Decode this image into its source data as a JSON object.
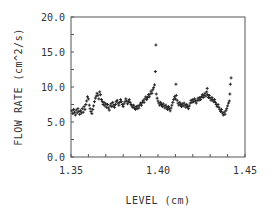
{
  "chart_data": {
    "type": "scatter",
    "title": "",
    "xlabel": "LEVEL (cm)",
    "ylabel": "FLOW RATE (cm^2/s)",
    "xlim": [
      1.35,
      1.45
    ],
    "ylim": [
      0.0,
      20.0
    ],
    "x_ticks": [
      1.35,
      1.4,
      1.45
    ],
    "x_tick_labels": [
      "1.35",
      "1.40",
      "1.45"
    ],
    "x_minor_step": 0.01,
    "y_ticks": [
      0.0,
      5.0,
      10.0,
      15.0,
      20.0
    ],
    "y_tick_labels": [
      "0.0",
      "5.0",
      "10.0",
      "15.0",
      "20.0"
    ],
    "y_minor_step": 2.5,
    "grid": false,
    "legend": null,
    "marker": "+",
    "series": [
      {
        "name": "flow rate",
        "color": "#222222",
        "points": [
          [
            1.3505,
            6.6
          ],
          [
            1.351,
            6.2
          ],
          [
            1.3515,
            6.8
          ],
          [
            1.352,
            6.4
          ],
          [
            1.3525,
            6.0
          ],
          [
            1.353,
            6.7
          ],
          [
            1.3535,
            6.3
          ],
          [
            1.354,
            6.9
          ],
          [
            1.3545,
            6.5
          ],
          [
            1.355,
            6.1
          ],
          [
            1.3555,
            6.6
          ],
          [
            1.356,
            6.3
          ],
          [
            1.3565,
            6.9
          ],
          [
            1.357,
            6.4
          ],
          [
            1.3575,
            7.2
          ],
          [
            1.358,
            6.8
          ],
          [
            1.3585,
            7.5
          ],
          [
            1.359,
            8.0
          ],
          [
            1.3595,
            8.6
          ],
          [
            1.36,
            8.3
          ],
          [
            1.3605,
            7.4
          ],
          [
            1.361,
            6.9
          ],
          [
            1.3615,
            6.5
          ],
          [
            1.362,
            6.2
          ],
          [
            1.3625,
            6.8
          ],
          [
            1.363,
            7.3
          ],
          [
            1.3635,
            7.9
          ],
          [
            1.364,
            8.4
          ],
          [
            1.3645,
            8.7
          ],
          [
            1.365,
            9.1
          ],
          [
            1.3655,
            8.8
          ],
          [
            1.366,
            8.3
          ],
          [
            1.3665,
            9.3
          ],
          [
            1.367,
            8.9
          ],
          [
            1.3675,
            8.2
          ],
          [
            1.368,
            7.9
          ],
          [
            1.3685,
            7.5
          ],
          [
            1.369,
            7.8
          ],
          [
            1.3695,
            7.3
          ],
          [
            1.37,
            7.6
          ],
          [
            1.3705,
            7.1
          ],
          [
            1.371,
            7.5
          ],
          [
            1.3715,
            7.0
          ],
          [
            1.372,
            6.7
          ],
          [
            1.3725,
            7.3
          ],
          [
            1.373,
            7.6
          ],
          [
            1.3735,
            7.2
          ],
          [
            1.374,
            7.8
          ],
          [
            1.3745,
            7.4
          ],
          [
            1.375,
            7.1
          ],
          [
            1.3755,
            7.5
          ],
          [
            1.376,
            7.9
          ],
          [
            1.3765,
            8.1
          ],
          [
            1.377,
            7.7
          ],
          [
            1.3775,
            7.4
          ],
          [
            1.378,
            7.8
          ],
          [
            1.3785,
            8.2
          ],
          [
            1.379,
            7.9
          ],
          [
            1.3795,
            7.5
          ],
          [
            1.38,
            7.2
          ],
          [
            1.3805,
            7.6
          ],
          [
            1.381,
            7.9
          ],
          [
            1.3815,
            8.3
          ],
          [
            1.382,
            8.0
          ],
          [
            1.3825,
            7.6
          ],
          [
            1.383,
            7.9
          ],
          [
            1.3835,
            8.2
          ],
          [
            1.384,
            7.8
          ],
          [
            1.3845,
            7.5
          ],
          [
            1.385,
            7.3
          ],
          [
            1.3855,
            7.1
          ],
          [
            1.386,
            7.4
          ],
          [
            1.3865,
            7.0
          ],
          [
            1.387,
            6.8
          ],
          [
            1.3875,
            7.2
          ],
          [
            1.388,
            6.9
          ],
          [
            1.3885,
            7.3
          ],
          [
            1.389,
            7.0
          ],
          [
            1.3895,
            7.4
          ],
          [
            1.39,
            7.7
          ],
          [
            1.3905,
            7.4
          ],
          [
            1.391,
            7.8
          ],
          [
            1.3915,
            8.1
          ],
          [
            1.392,
            7.8
          ],
          [
            1.3925,
            8.3
          ],
          [
            1.393,
            8.6
          ],
          [
            1.3935,
            8.2
          ],
          [
            1.394,
            8.5
          ],
          [
            1.3945,
            8.9
          ],
          [
            1.395,
            8.6
          ],
          [
            1.3955,
            9.0
          ],
          [
            1.396,
            9.4
          ],
          [
            1.3965,
            9.1
          ],
          [
            1.397,
            9.6
          ],
          [
            1.3975,
            9.9
          ],
          [
            1.398,
            10.3
          ],
          [
            1.3985,
            12.2
          ],
          [
            1.3988,
            16.0
          ],
          [
            1.399,
            9.0
          ],
          [
            1.3995,
            8.4
          ],
          [
            1.4,
            8.0
          ],
          [
            1.4005,
            7.7
          ],
          [
            1.401,
            7.4
          ],
          [
            1.4015,
            7.8
          ],
          [
            1.402,
            7.5
          ],
          [
            1.4025,
            7.2
          ],
          [
            1.403,
            7.6
          ],
          [
            1.4035,
            7.3
          ],
          [
            1.404,
            7.0
          ],
          [
            1.4045,
            7.4
          ],
          [
            1.405,
            7.1
          ],
          [
            1.4055,
            6.8
          ],
          [
            1.406,
            7.2
          ],
          [
            1.4065,
            6.9
          ],
          [
            1.407,
            6.6
          ],
          [
            1.4075,
            7.0
          ],
          [
            1.408,
            7.4
          ],
          [
            1.4085,
            7.8
          ],
          [
            1.409,
            8.2
          ],
          [
            1.4095,
            8.6
          ],
          [
            1.41,
            8.3
          ],
          [
            1.4103,
            10.4
          ],
          [
            1.4105,
            8.8
          ],
          [
            1.411,
            8.1
          ],
          [
            1.4115,
            7.7
          ],
          [
            1.412,
            7.4
          ],
          [
            1.4125,
            7.8
          ],
          [
            1.413,
            7.5
          ],
          [
            1.4135,
            7.2
          ],
          [
            1.414,
            7.6
          ],
          [
            1.4145,
            7.3
          ],
          [
            1.415,
            7.7
          ],
          [
            1.4155,
            7.4
          ],
          [
            1.416,
            7.1
          ],
          [
            1.4165,
            7.5
          ],
          [
            1.417,
            7.2
          ],
          [
            1.4175,
            6.9
          ],
          [
            1.418,
            7.3
          ],
          [
            1.4185,
            7.7
          ],
          [
            1.419,
            8.1
          ],
          [
            1.4195,
            7.8
          ],
          [
            1.42,
            8.2
          ],
          [
            1.4205,
            7.9
          ],
          [
            1.421,
            8.3
          ],
          [
            1.4215,
            8.0
          ],
          [
            1.422,
            7.7
          ],
          [
            1.4225,
            8.1
          ],
          [
            1.423,
            8.4
          ],
          [
            1.4235,
            8.1
          ],
          [
            1.424,
            8.5
          ],
          [
            1.4245,
            8.2
          ],
          [
            1.425,
            8.6
          ],
          [
            1.4255,
            8.9
          ],
          [
            1.426,
            8.5
          ],
          [
            1.4265,
            8.8
          ],
          [
            1.427,
            9.1
          ],
          [
            1.4275,
            8.7
          ],
          [
            1.428,
            9.3
          ],
          [
            1.4283,
            9.8
          ],
          [
            1.4285,
            8.9
          ],
          [
            1.429,
            8.5
          ],
          [
            1.4295,
            8.8
          ],
          [
            1.43,
            8.4
          ],
          [
            1.4305,
            8.1
          ],
          [
            1.431,
            8.5
          ],
          [
            1.4315,
            8.2
          ],
          [
            1.432,
            7.9
          ],
          [
            1.4325,
            8.2
          ],
          [
            1.433,
            7.8
          ],
          [
            1.4335,
            7.5
          ],
          [
            1.434,
            7.2
          ],
          [
            1.4345,
            7.5
          ],
          [
            1.435,
            7.1
          ],
          [
            1.4355,
            6.8
          ],
          [
            1.436,
            6.5
          ],
          [
            1.4365,
            6.8
          ],
          [
            1.437,
            6.3
          ],
          [
            1.4375,
            6.0
          ],
          [
            1.438,
            6.4
          ],
          [
            1.4385,
            6.1
          ],
          [
            1.439,
            6.6
          ],
          [
            1.4395,
            6.9
          ],
          [
            1.44,
            7.3
          ],
          [
            1.4405,
            7.7
          ],
          [
            1.441,
            8.0
          ],
          [
            1.4413,
            9.0
          ],
          [
            1.4416,
            10.4
          ],
          [
            1.442,
            11.3
          ]
        ]
      }
    ]
  }
}
